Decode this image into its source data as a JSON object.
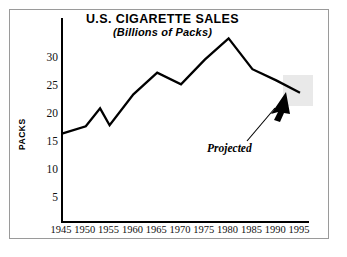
{
  "chart_data": {
    "type": "line",
    "title": "U.S. CIGARETTE SALES",
    "subtitle": "(Billions of Packs)",
    "xlabel": "",
    "ylabel": "PACKS",
    "x": [
      1945,
      1950,
      1955,
      1960,
      1965,
      1970,
      1975,
      1980,
      1985,
      1990,
      1995
    ],
    "categories": [
      "1945",
      "1950",
      "1955",
      "1960",
      "1965",
      "1970",
      "1975",
      "1980",
      "1985",
      "1990",
      "1995"
    ],
    "values": [
      16.5,
      17.8,
      18.0,
      23.5,
      27.4,
      25.3,
      29.7,
      33.5,
      28.0,
      26.0,
      23.8
    ],
    "series": [
      {
        "name": "U.S. Cigarette Sales",
        "values": [
          16.5,
          17.8,
          18.0,
          23.5,
          27.4,
          25.3,
          29.7,
          33.5,
          28.0,
          26.0,
          23.8
        ]
      }
    ],
    "extra_vertices": [
      {
        "x": 1953,
        "y": 21.0
      },
      {
        "x": 1955,
        "y": 18.0
      }
    ],
    "ylim": [
      0,
      35
    ],
    "xlim": [
      1945,
      1995
    ],
    "ytick_labels": [
      "5",
      "10",
      "15",
      "20",
      "25",
      "30"
    ],
    "ytick_values": [
      5,
      10,
      15,
      20,
      25,
      30
    ],
    "xtick_labels": [
      "1945",
      "1950",
      "1955",
      "1960",
      "1965",
      "1970",
      "1975",
      "1980",
      "1985",
      "1990",
      "1995"
    ],
    "grid": false,
    "legend": false,
    "legend_position": "none",
    "line_color": "#000000",
    "annotations": [
      {
        "text": "Projected",
        "type": "arrow-callout",
        "points_to_year": 1995,
        "points_to_value": 24.0
      }
    ],
    "shaded_regions": [
      {
        "name": "projected-band",
        "color": "#e9e9e9",
        "from_year": 1993,
        "to_year": 1997
      }
    ]
  },
  "colors": {
    "frame": "#9a9a9a",
    "axis": "#000000",
    "line": "#000000",
    "shade": "#e9e9e9",
    "background": "#ffffff"
  }
}
